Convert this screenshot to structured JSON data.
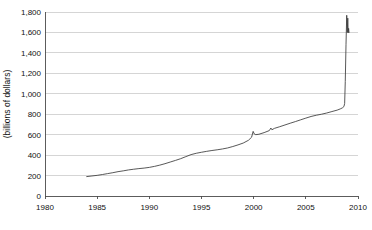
{
  "chart_data": {
    "type": "line",
    "title": "",
    "subtitle": "",
    "xlabel": "",
    "ylabel": "(billions of dollars)",
    "xlim": [
      1980,
      2010
    ],
    "ylim": [
      0,
      1800
    ],
    "xticks": [
      "1980",
      "1985",
      "1990",
      "1995",
      "2000",
      "2005",
      "2010"
    ],
    "xtick_values": [
      1980,
      1985,
      1990,
      1995,
      2000,
      2005,
      2010
    ],
    "yticks": [
      "0",
      "200",
      "400",
      "600",
      "800",
      "1,000",
      "1,200",
      "1,400",
      "1,600",
      "1,800"
    ],
    "ytick_values": [
      0,
      200,
      400,
      600,
      800,
      1000,
      1200,
      1400,
      1600,
      1800
    ],
    "grid": "horizontal",
    "legend": "none",
    "series": [
      {
        "name": "series-1",
        "color": "#3a3a3a",
        "x": [
          1984.0,
          1984.5,
          1985.0,
          1985.5,
          1986.0,
          1986.5,
          1987.0,
          1987.5,
          1988.0,
          1988.5,
          1989.0,
          1989.5,
          1990.0,
          1990.5,
          1991.0,
          1991.5,
          1992.0,
          1992.5,
          1993.0,
          1993.5,
          1994.0,
          1994.5,
          1995.0,
          1995.5,
          1996.0,
          1996.5,
          1997.0,
          1997.5,
          1998.0,
          1998.5,
          1999.0,
          1999.5,
          1999.8,
          1999.95,
          2000.05,
          2000.2,
          2000.5,
          2001.0,
          2001.5,
          2001.65,
          2001.75,
          2002.0,
          2002.5,
          2003.0,
          2003.5,
          2004.0,
          2004.5,
          2005.0,
          2005.5,
          2006.0,
          2006.5,
          2007.0,
          2007.5,
          2008.0,
          2008.3,
          2008.5,
          2008.65,
          2008.72,
          2008.78,
          2008.85,
          2008.92,
          2008.97,
          2009.02,
          2009.06,
          2009.1,
          2009.14
        ],
        "y": [
          190,
          196,
          202,
          210,
          219,
          228,
          238,
          246,
          255,
          262,
          268,
          273,
          280,
          290,
          302,
          316,
          332,
          348,
          365,
          385,
          405,
          418,
          428,
          437,
          445,
          452,
          460,
          470,
          484,
          500,
          518,
          545,
          575,
          632,
          608,
          600,
          604,
          620,
          640,
          665,
          648,
          662,
          678,
          695,
          712,
          728,
          745,
          762,
          778,
          790,
          800,
          812,
          826,
          840,
          852,
          862,
          875,
          905,
          1120,
          1480,
          1768,
          1600,
          1740,
          1596,
          1640,
          1600
        ]
      }
    ],
    "annotations": []
  }
}
